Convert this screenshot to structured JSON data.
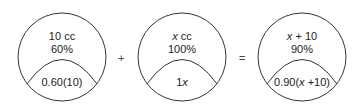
{
  "diagram": {
    "containers": [
      {
        "top_line1": "10 cc",
        "top_line2": "60%",
        "bottom": "0.60(10)"
      },
      {
        "top_line1_var": "x",
        "top_line1_rest": " cc",
        "top_line2": "100%",
        "bottom_num": "1",
        "bottom_var": "x"
      },
      {
        "top_line1_var": "x",
        "top_line1_rest": " + 10",
        "top_line2": "90%",
        "bottom_pre": "0.90(",
        "bottom_var": "x",
        "bottom_post": " +10)"
      }
    ],
    "operators": {
      "plus": "+",
      "equals": "="
    },
    "stroke_color": "#333333"
  }
}
